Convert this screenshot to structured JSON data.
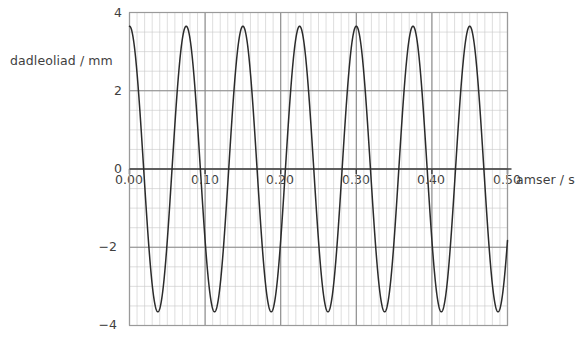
{
  "chart_data": {
    "type": "line",
    "title": "",
    "xlabel": "amser / s",
    "ylabel": "dadleoliad / mm",
    "xlim": [
      0.0,
      0.5
    ],
    "ylim": [
      -4,
      4
    ],
    "xticks": [
      "0.00",
      "0.10",
      "0.20",
      "0.30",
      "0.40",
      "0.50"
    ],
    "xtick_values": [
      0.0,
      0.1,
      0.2,
      0.3,
      0.4,
      0.5
    ],
    "yticks": [
      "4",
      "2",
      "0",
      "−2",
      "−4"
    ],
    "ytick_values": [
      4,
      2,
      0,
      -2,
      -4
    ],
    "grid": "major and minor",
    "major_grid_x_step": 0.1,
    "major_grid_y_step": 2,
    "minor_grid_x_step": 0.01,
    "minor_grid_y_step": 0.5,
    "legend": "none",
    "series": [
      {
        "name": "dadleoliad",
        "waveform": "sine",
        "amplitude_mm": 3.65,
        "period_s": 0.075,
        "frequency_hz": 13.33,
        "phase": "cosine (starts at maximum)",
        "x": [
          0.0,
          0.005,
          0.01,
          0.015,
          0.02,
          0.025,
          0.03,
          0.035,
          0.04,
          0.045,
          0.05,
          0.055,
          0.06,
          0.065,
          0.07,
          0.075,
          0.08,
          0.085,
          0.09,
          0.095,
          0.1,
          0.105,
          0.11,
          0.115,
          0.12,
          0.125,
          0.13,
          0.135,
          0.14,
          0.145,
          0.15,
          0.155,
          0.16,
          0.165,
          0.17,
          0.175,
          0.18,
          0.185,
          0.19,
          0.195,
          0.2,
          0.205,
          0.21,
          0.215,
          0.22,
          0.225,
          0.23,
          0.235,
          0.24,
          0.245,
          0.25,
          0.255,
          0.26,
          0.265,
          0.27,
          0.275,
          0.28,
          0.285,
          0.29,
          0.295,
          0.3,
          0.305,
          0.31,
          0.315,
          0.32,
          0.325,
          0.33,
          0.335,
          0.34,
          0.345,
          0.35,
          0.355,
          0.36,
          0.365,
          0.37,
          0.375,
          0.38,
          0.385,
          0.39,
          0.395,
          0.4,
          0.405,
          0.41,
          0.415,
          0.42,
          0.425,
          0.43,
          0.435,
          0.44,
          0.445,
          0.45,
          0.455,
          0.46,
          0.465,
          0.47,
          0.475,
          0.48,
          0.485,
          0.49,
          0.495,
          0.5
        ],
        "y": [
          3.65,
          3.36,
          2.53,
          1.33,
          -0.08,
          -1.46,
          -2.62,
          -3.4,
          -3.65,
          -3.36,
          -2.53,
          -1.33,
          0.08,
          1.46,
          2.62,
          3.4,
          3.65,
          3.36,
          2.53,
          1.33,
          -0.08,
          -1.46,
          -2.62,
          -3.4,
          -3.65,
          -3.36,
          -2.53,
          -1.33,
          0.08,
          1.46,
          2.62,
          3.4,
          3.65,
          3.36,
          2.53,
          1.33,
          -0.08,
          -1.46,
          -2.62,
          -3.4,
          -3.65,
          -3.36,
          -2.53,
          -1.33,
          0.08,
          1.46,
          2.62,
          3.4,
          3.65,
          3.36,
          2.53,
          1.33,
          -0.08,
          -1.46,
          -2.62,
          -3.4,
          -3.65,
          -3.36,
          -2.53,
          -1.33,
          0.08,
          1.46,
          2.62,
          3.4,
          3.65,
          3.36,
          2.53,
          1.33,
          -0.08,
          -1.46,
          -2.62,
          -3.4,
          -3.65,
          -3.36,
          -2.53,
          -1.33,
          0.08,
          1.46,
          2.62,
          3.4,
          3.65,
          3.36,
          2.53,
          1.33,
          -0.08,
          -1.46,
          -2.62,
          -3.4,
          -3.65,
          -3.36,
          -2.53,
          -1.33,
          0.08,
          1.46,
          2.62,
          3.4,
          3.65,
          3.36,
          2.53,
          1.33,
          -0.08
        ]
      }
    ],
    "colors": {
      "curve": "#2b2b2b",
      "axis": "#404040",
      "major_grid": "#8a8a8a",
      "minor_grid": "#c8c8c8",
      "plot_border": "#9a9a9a",
      "text": "#3f3f3f"
    }
  }
}
